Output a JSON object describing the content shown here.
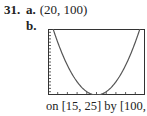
{
  "problem": {
    "number": "31.",
    "part_a": {
      "label": "a.",
      "answer": "(20, 100)"
    },
    "part_b": {
      "label": "b."
    },
    "caption": "on [15, 25] by [100, 120]"
  },
  "chart_data": {
    "type": "line",
    "title": "",
    "function": "y = (x - 20)^2 + 100",
    "xlabel": "",
    "ylabel": "",
    "xlim": [
      15,
      25
    ],
    "ylim": [
      100,
      120
    ],
    "x_tick_step": 1,
    "y_tick_step": 1,
    "grid": false,
    "legend": null,
    "vertex": [
      20,
      100
    ],
    "series": [
      {
        "name": "parabola",
        "x": [
          15.53,
          16,
          17,
          18,
          19,
          20,
          21,
          22,
          23,
          24,
          24.47
        ],
        "values": [
          120,
          116,
          109,
          104,
          101,
          100,
          101,
          104,
          109,
          116,
          120
        ]
      }
    ],
    "colors": {
      "curve": "#555555",
      "axes": "#333333"
    }
  }
}
